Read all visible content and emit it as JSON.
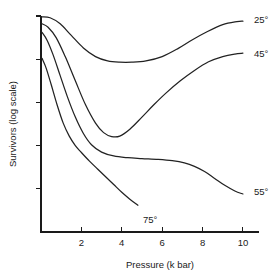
{
  "chart_data": {
    "type": "line",
    "title": "",
    "xlabel": "Pressure (k bar)",
    "ylabel": "Survivors (log scale)",
    "xlim": [
      0,
      10.4
    ],
    "ylim": [
      0,
      5
    ],
    "grid": false,
    "legend": "inline-end-labels",
    "xticks": [
      {
        "value": 2,
        "label": "2"
      },
      {
        "value": 4,
        "label": "4"
      },
      {
        "value": 6,
        "label": "6"
      },
      {
        "value": 8,
        "label": "8"
      },
      {
        "value": 10,
        "label": "10"
      }
    ],
    "yticks": [
      {
        "value": 5,
        "label": ""
      },
      {
        "value": 4,
        "label": ""
      },
      {
        "value": 3,
        "label": ""
      },
      {
        "value": 2,
        "label": ""
      },
      {
        "value": 1,
        "label": ""
      }
    ],
    "series": [
      {
        "name": "25°",
        "label": "25°",
        "label_x": 10.55,
        "label_y": 4.92,
        "x": [
          0.05,
          0.45,
          0.95,
          1.5,
          2.1,
          2.7,
          3.3,
          3.9,
          4.5,
          5.2,
          6.0,
          6.8,
          7.5,
          8.2,
          9.0,
          9.7,
          10.0
        ],
        "y": [
          4.98,
          4.96,
          4.82,
          4.55,
          4.26,
          4.06,
          3.96,
          3.93,
          3.93,
          3.96,
          4.06,
          4.25,
          4.45,
          4.63,
          4.8,
          4.87,
          4.88
        ]
      },
      {
        "name": "45°",
        "label": "45°",
        "label_x": 10.55,
        "label_y": 4.13,
        "x": [
          0.05,
          0.35,
          0.75,
          1.2,
          1.7,
          2.2,
          2.7,
          3.1,
          3.5,
          3.9,
          4.4,
          5.0,
          5.6,
          6.2,
          6.9,
          7.6,
          8.3,
          9.0,
          9.6,
          10.0
        ],
        "y": [
          4.82,
          4.74,
          4.5,
          4.06,
          3.5,
          2.95,
          2.52,
          2.3,
          2.21,
          2.22,
          2.38,
          2.66,
          2.95,
          3.22,
          3.5,
          3.74,
          3.94,
          4.06,
          4.12,
          4.14
        ]
      },
      {
        "name": "55°",
        "label": "55°",
        "label_x": 10.55,
        "label_y": 0.93,
        "x": [
          0.05,
          0.3,
          0.6,
          0.95,
          1.3,
          1.7,
          2.1,
          2.5,
          3.0,
          3.6,
          4.3,
          5.0,
          5.8,
          6.5,
          7.1,
          7.6,
          8.1,
          8.6,
          9.1,
          9.6,
          10.0
        ],
        "y": [
          4.62,
          4.44,
          4.1,
          3.62,
          3.14,
          2.66,
          2.28,
          2.02,
          1.85,
          1.76,
          1.72,
          1.7,
          1.68,
          1.65,
          1.6,
          1.52,
          1.4,
          1.24,
          1.08,
          0.95,
          0.88
        ]
      },
      {
        "name": "75°",
        "label": "75°",
        "label_x": 5.05,
        "label_y": 0.28,
        "x": [
          0.05,
          0.25,
          0.5,
          0.8,
          1.1,
          1.4,
          1.7,
          2.0,
          2.4,
          2.8,
          3.2,
          3.6,
          4.0,
          4.4,
          4.8
        ],
        "y": [
          4.02,
          3.8,
          3.42,
          2.94,
          2.52,
          2.22,
          2.0,
          1.84,
          1.64,
          1.46,
          1.28,
          1.1,
          0.92,
          0.76,
          0.62
        ]
      }
    ]
  },
  "axes": {
    "x_title": "Pressure (k bar)",
    "y_title": "Survivors (log scale)"
  }
}
